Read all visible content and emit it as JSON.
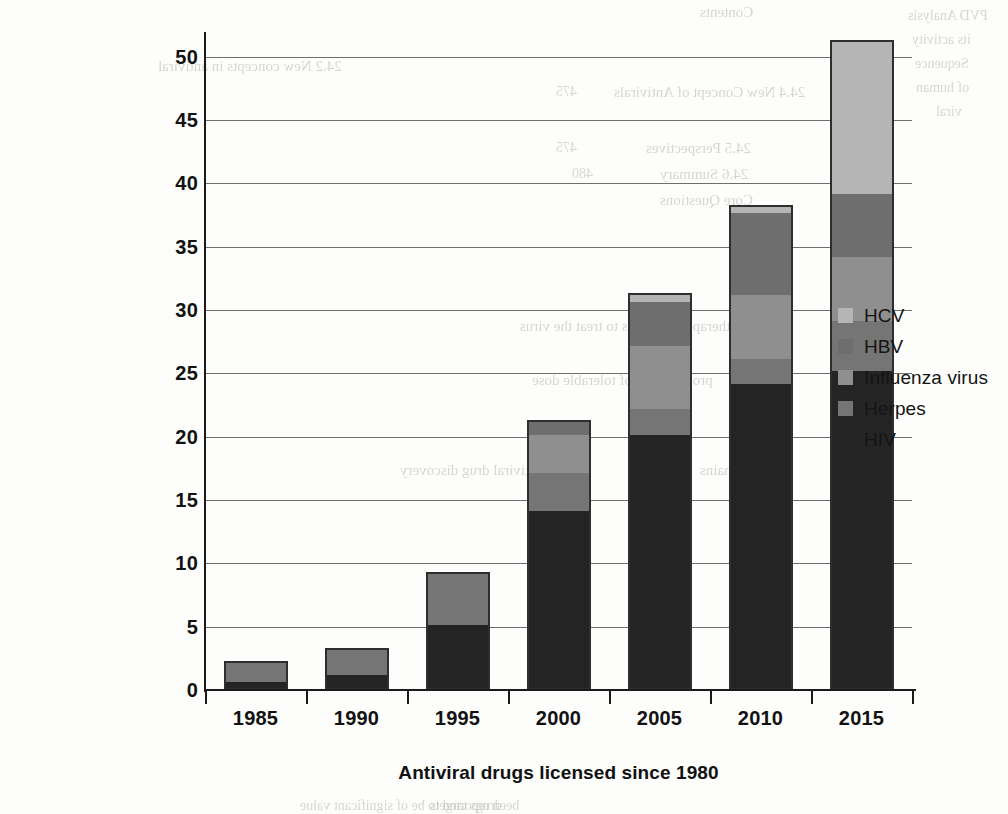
{
  "chart_data": {
    "type": "bar",
    "subtype": "stacked-bar",
    "title": "",
    "xlabel": "Antiviral drugs licensed since 1980",
    "ylabel": "Number of antiviral drugs",
    "categories": [
      "1985",
      "1990",
      "1995",
      "2000",
      "2005",
      "2010",
      "2015"
    ],
    "ylim": [
      0,
      51
    ],
    "yticks": [
      0,
      5,
      10,
      15,
      20,
      25,
      30,
      35,
      40,
      45,
      50
    ],
    "ytick_labels": [
      "0",
      "5",
      "10",
      "15",
      "20",
      "25",
      "30",
      "35",
      "40",
      "45",
      "50"
    ],
    "grid": true,
    "grid_axis": "y",
    "legend_position": "right",
    "series": [
      {
        "name": "HIV",
        "color": "#242424",
        "values": [
          0.5,
          1,
          5,
          14,
          20,
          24,
          25
        ]
      },
      {
        "name": "Herpes",
        "color": "#757575",
        "values": [
          1.5,
          2,
          4,
          3,
          2,
          2,
          4
        ]
      },
      {
        "name": "Influenza virus",
        "color": "#8f8f8f",
        "values": [
          0,
          0,
          0,
          3,
          5,
          5,
          5
        ]
      },
      {
        "name": "HBV",
        "color": "#6e6e6e",
        "values": [
          0,
          0,
          0,
          1,
          3.5,
          6.5,
          5
        ]
      },
      {
        "name": "HCV",
        "color": "#b5b5b5",
        "values": [
          0,
          0,
          0,
          0,
          0.5,
          0.5,
          12
        ]
      }
    ],
    "totals": [
      2,
      3,
      9,
      21,
      31,
      38,
      51
    ]
  },
  "legend": {
    "items": [
      {
        "label": "HCV",
        "color": "#b5b5b5"
      },
      {
        "label": "HBV",
        "color": "#6e6e6e"
      },
      {
        "label": "Influenza virus",
        "color": "#8f8f8f"
      },
      {
        "label": "Herpes",
        "color": "#757575"
      },
      {
        "label": "HIV",
        "color": "#242424"
      }
    ]
  },
  "page_bleed": [
    {
      "text": "Contents",
      "x": 700,
      "y": 4,
      "size": 15
    },
    {
      "text": "24.4  New Concept of Antivirals",
      "x": 614,
      "y": 84,
      "size": 15
    },
    {
      "text": "475",
      "x": 556,
      "y": 84,
      "size": 14
    },
    {
      "text": "24.5  Perspectives",
      "x": 646,
      "y": 140,
      "size": 15
    },
    {
      "text": "475",
      "x": 556,
      "y": 140,
      "size": 14
    },
    {
      "text": "24.6  Summary",
      "x": 660,
      "y": 166,
      "size": 15
    },
    {
      "text": "480",
      "x": 572,
      "y": 166,
      "size": 14
    },
    {
      "text": "Core Questions",
      "x": 660,
      "y": 192,
      "size": 15
    },
    {
      "text": "PVD Analysis",
      "x": 908,
      "y": 8,
      "size": 14
    },
    {
      "text": "its activity",
      "x": 912,
      "y": 32,
      "size": 14
    },
    {
      "text": "Sequence",
      "x": 915,
      "y": 56,
      "size": 14
    },
    {
      "text": "of human",
      "x": 916,
      "y": 80,
      "size": 14
    },
    {
      "text": "viral",
      "x": 936,
      "y": 104,
      "size": 14
    },
    {
      "text": "therapeutic agents to treat the virus",
      "x": 520,
      "y": 318,
      "size": 15
    },
    {
      "text": "provide drug of tolerable dose",
      "x": 532,
      "y": 372,
      "size": 15
    },
    {
      "text": "Antiviral drug discovery",
      "x": 400,
      "y": 462,
      "size": 15
    },
    {
      "text": "still remains",
      "x": 700,
      "y": 462,
      "size": 15
    },
    {
      "text": "24.2  New concepts in antiviral",
      "x": 158,
      "y": 58,
      "size": 15
    },
    {
      "text": "drugs targets",
      "x": 430,
      "y": 798,
      "size": 14
    },
    {
      "text": "been reported to be of significant value",
      "x": 300,
      "y": 798,
      "size": 14
    }
  ]
}
